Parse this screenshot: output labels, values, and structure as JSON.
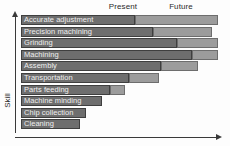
{
  "chart_data": {
    "type": "bar",
    "title": "",
    "subtitle": "",
    "orientation": "horizontal",
    "stacked": true,
    "xlabel": "",
    "ylabel": "Skill",
    "grid": false,
    "legend_position": "top",
    "column_headers": [
      "Present",
      "Future"
    ],
    "xlim": [
      0,
      100
    ],
    "categories": [
      "Accurate adjustment",
      "Precision machining",
      "Grinding",
      "Machining",
      "Assembly",
      "Transportation",
      "Parts feeding",
      "Machine minding",
      "Chip collection",
      "Cleaning"
    ],
    "series": [
      {
        "name": "Present",
        "color": "#6e6e6e",
        "values": [
          58,
          67,
          79,
          87,
          71,
          55,
          45,
          41,
          33,
          30
        ]
      },
      {
        "name": "Future",
        "color": "#9c9c9c",
        "values": [
          42,
          30,
          21,
          13,
          19,
          15,
          8,
          0,
          0,
          0
        ]
      }
    ],
    "annotations": [
      "Bars extend further right for lower-skill tasks being automated sooner",
      "Upper rows combine a dark Present segment with a lighter Future segment",
      "Bottom three rows show only the Present segment"
    ]
  },
  "axes": {
    "y_label": "Skill",
    "y_arrow": "up-arrow",
    "x_arrow": "right-arrow"
  },
  "header": {
    "present": "Present",
    "future": "Future"
  }
}
